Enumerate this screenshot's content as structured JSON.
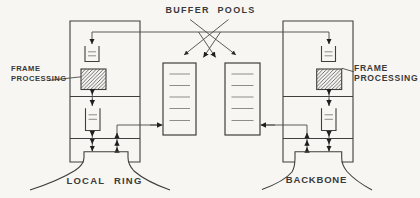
{
  "diagram": {
    "type": "network-bridge-architecture",
    "labels": {
      "buffer_pools": "BUFFER POOLS",
      "frame_processing": {
        "line1": "FRAME",
        "line2": "PROCESSING"
      },
      "local_ring": "LOCAL RING",
      "backbone": "BACKBONE"
    },
    "components": [
      "left-bridge-unit",
      "right-bridge-unit",
      "buffer-pool-left",
      "buffer-pool-right",
      "frame-processing-box-left",
      "frame-processing-box-right",
      "top-queue-left",
      "top-queue-right",
      "lower-queue-left",
      "lower-queue-right",
      "local-ring-attachment",
      "backbone-attachment"
    ],
    "icons": {
      "queue-icon": "open-top rectangle with stacked horizontal lines",
      "buffer-pool-icon": "tall rectangle with five buffer slots",
      "frame-processing-icon": "diagonally hatched rectangle",
      "ring-attachment-icon": "funnel neck flaring into ring curve",
      "arrowhead-icon": "small solid triangle"
    },
    "colors": {
      "paper": "#f7f6f3",
      "ink": "#3f3f3f",
      "slot_lines": "#8d8d8d",
      "arrowhead": "#1f1f1f"
    }
  }
}
